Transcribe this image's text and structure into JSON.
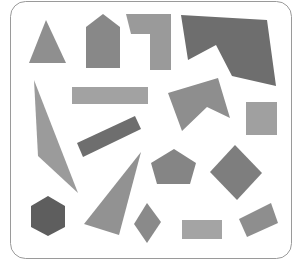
{
  "frame": {
    "x": 10.5,
    "y": 1.5,
    "width": 281,
    "height": 257,
    "radius": 15,
    "stroke": "#9a9a9a",
    "fill": "#ffffff"
  },
  "colors": {
    "light": "#9e9e9e",
    "mid": "#8c8c8c",
    "dark": "#6c6c6c"
  },
  "shapes": [
    {
      "name": "triangle",
      "fill": "#8f8f8f",
      "points": "46,20 66,63 29,63"
    },
    {
      "name": "house-pentagon",
      "fill": "#888888",
      "points": "86,27 103,14 120,27 120,68 86,68"
    },
    {
      "name": "l-shape",
      "fill": "#9a9a9a",
      "points": "126,14 171,14 171,70 150,70 150,34 131,34"
    },
    {
      "name": "dark-polygon",
      "fill": "#6e6e6e",
      "points": "181,15 267,20 276,86 232,76 216,45 188,60"
    },
    {
      "name": "horizontal-bar",
      "fill": "#a2a2a2",
      "points": "72,87 148,87 148,104 72,104"
    },
    {
      "name": "chevron",
      "fill": "#8e8e8e",
      "points": "168,93 218,78 230,118 207,107 182,131"
    },
    {
      "name": "square",
      "fill": "#a0a0a0",
      "points": "246,102 277,102 277,135 246,135"
    },
    {
      "name": "sliver-triangle",
      "fill": "#9b9b9b",
      "points": "34,80 78,193 38,156"
    },
    {
      "name": "dark-tilted-bar",
      "fill": "#6e6e6e",
      "points": "77,143 135,116 141,129 83,157"
    },
    {
      "name": "big-triangle",
      "fill": "#929292",
      "points": "141,152 119,235 84,224"
    },
    {
      "name": "pentagon",
      "fill": "#858585",
      "points": "174,149 196,163 190,184 157,184 151,163"
    },
    {
      "name": "diamond",
      "fill": "#7e7e7e",
      "points": "235,145 262,173 237,200 210,172"
    },
    {
      "name": "hexagon",
      "fill": "#5e5e5e",
      "points": "48,196 65,206 65,227 48,236 31,227 31,206"
    },
    {
      "name": "small-diamond",
      "fill": "#8a8a8a",
      "points": "147,203 161,222 147,243 134,224"
    },
    {
      "name": "bottom-rect",
      "fill": "#a4a4a4",
      "points": "182,220 222,220 222,239 182,239"
    },
    {
      "name": "tilted-rect",
      "fill": "#8e8e8e",
      "points": "239,219 271,203 278,223 247,237"
    }
  ]
}
